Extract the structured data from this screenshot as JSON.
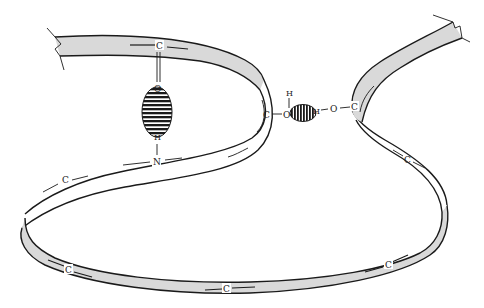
{
  "diagram": {
    "colors": {
      "ribbon_front": "#d9d9d9",
      "ribbon_back": "#ffffff",
      "outline": "#1a1a1a",
      "hbond_hatch": "#1a1a1a"
    },
    "backbone_atoms": [
      {
        "id": "c_top",
        "label": "C"
      },
      {
        "id": "c_mid",
        "label": "C"
      },
      {
        "id": "c_right",
        "label": "C"
      },
      {
        "id": "c_right_back",
        "label": "C"
      },
      {
        "id": "c_left_back",
        "label": "C"
      },
      {
        "id": "c_left_front",
        "label": "C"
      },
      {
        "id": "c_bottom",
        "label": "C"
      },
      {
        "id": "c_bottom_right",
        "label": "C"
      },
      {
        "id": "n_mid",
        "label": "N"
      }
    ],
    "hbond_1": {
      "donor_h": "H",
      "acceptor_o": "O",
      "orientation": "vertical"
    },
    "hbond_2": {
      "left_o": "O",
      "left_h": "H",
      "right_h": "H",
      "right_o": "O",
      "orientation": "horizontal"
    }
  }
}
